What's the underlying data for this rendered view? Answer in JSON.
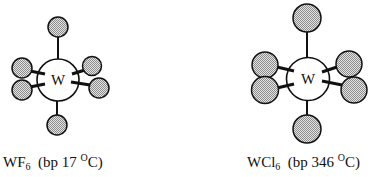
{
  "figure": {
    "colors": {
      "bond": "#111111",
      "ligand_fill": "#bdbdbd",
      "ligand_pattern_dark": "#8c8c8c",
      "ligand_pattern_light": "#e4e4e4",
      "metal_fill": "#ffffff",
      "outline": "#111111"
    }
  },
  "molecules": [
    {
      "id": "wf6",
      "central_atom": "W",
      "ligand": "F",
      "ligand_count": 6,
      "formula_base": "WF",
      "formula_subscript": "6",
      "bp_prefix": "(bp 17 ",
      "bp_degree": "O",
      "bp_suffix": "C)",
      "boiling_point_c": 17,
      "metal": {
        "cx": 58,
        "cy": 80,
        "r": 21
      },
      "ligands": [
        {
          "pos": "top",
          "cx": 58,
          "cy": 27,
          "r": 10
        },
        {
          "pos": "bottom",
          "cx": 57,
          "cy": 125,
          "r": 10
        },
        {
          "pos": "upper-left",
          "cx": 22,
          "cy": 68,
          "r": 10
        },
        {
          "pos": "lower-left",
          "cx": 22,
          "cy": 90,
          "r": 10
        },
        {
          "pos": "upper-right",
          "cx": 92,
          "cy": 66,
          "r": 9.5
        },
        {
          "pos": "lower-right",
          "cx": 99,
          "cy": 88,
          "r": 10
        }
      ]
    },
    {
      "id": "wcl6",
      "central_atom": "W",
      "ligand": "Cl",
      "ligand_count": 6,
      "formula_base": "WCl",
      "formula_subscript": "6",
      "bp_prefix": "(bp 346 ",
      "bp_degree": "O",
      "bp_suffix": "C)",
      "boiling_point_c": 346,
      "metal": {
        "cx": 308,
        "cy": 79,
        "r": 21.5
      },
      "ligands": [
        {
          "pos": "top",
          "cx": 307,
          "cy": 18,
          "r": 14
        },
        {
          "pos": "bottom",
          "cx": 307,
          "cy": 129,
          "r": 14
        },
        {
          "pos": "upper-left",
          "cx": 265,
          "cy": 65,
          "r": 13
        },
        {
          "pos": "lower-left",
          "cx": 265,
          "cy": 90,
          "r": 13.5
        },
        {
          "pos": "upper-right",
          "cx": 349,
          "cy": 64,
          "r": 13
        },
        {
          "pos": "lower-right",
          "cx": 354,
          "cy": 90,
          "r": 13
        }
      ]
    }
  ]
}
